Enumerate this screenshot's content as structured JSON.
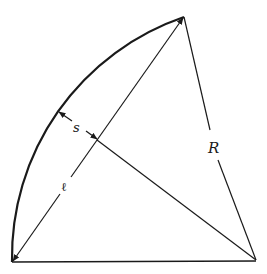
{
  "diagram": {
    "type": "geometry",
    "labels": {
      "sagitta": "s",
      "radius": "R",
      "chord": "ℓ"
    },
    "points": {
      "top": [
        184,
        17
      ],
      "center": [
        256,
        260
      ],
      "bottom_left": [
        12,
        262
      ],
      "chord_midpoint": [
        97,
        140
      ],
      "arc_point": [
        59,
        112
      ]
    },
    "colors": {
      "stroke": "#1a1a1a",
      "background": "#ffffff"
    }
  }
}
